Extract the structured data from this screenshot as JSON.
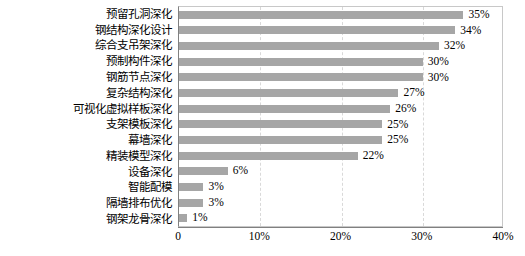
{
  "chart_data": {
    "type": "bar",
    "orientation": "horizontal",
    "title": "",
    "xlabel": "",
    "ylabel": "",
    "xlim": [
      0,
      40
    ],
    "xtick_labels": [
      "0",
      "10%",
      "20%",
      "30%",
      "40%"
    ],
    "xtick_values": [
      0,
      10,
      20,
      30,
      40
    ],
    "grid": true,
    "grid_axis": "x",
    "legend": false,
    "bar_color": "#a6a6a6",
    "plot_border_color": "#c8c8c8",
    "axis_color": "#808080",
    "gridline_color": "#d9d9d9",
    "value_label_suffix": "%",
    "categories": [
      "预留孔洞深化",
      "钢结构深化设计",
      "综合支吊架深化",
      "预制构件深化",
      "钢筋节点深化",
      "复杂结构深化",
      "可视化虚拟样板深化",
      "支架模板深化",
      "幕墙深化",
      "精装模型深化",
      "设备深化",
      "智能配模",
      "隔墙排布优化",
      "钢架龙骨深化"
    ],
    "values": [
      35,
      34,
      32,
      30,
      30,
      27,
      26,
      25,
      25,
      22,
      6,
      3,
      3,
      1
    ],
    "value_labels": [
      "35%",
      "34%",
      "32%",
      "30%",
      "30%",
      "27%",
      "26%",
      "25%",
      "25%",
      "22%",
      "6%",
      "3%",
      "3%",
      "1%"
    ]
  }
}
